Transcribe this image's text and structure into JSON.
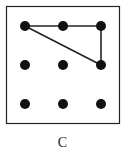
{
  "figure": {
    "label": "C",
    "box": {
      "x": 6,
      "y": 6,
      "w": 114,
      "h": 118,
      "stroke": "#222222"
    },
    "grid": {
      "cols_x": [
        25,
        63,
        101
      ],
      "rows_y": [
        26,
        65,
        104
      ],
      "dot_radius": 5,
      "dot_color": "#111111"
    },
    "lines": [
      {
        "from": [
          0,
          0
        ],
        "to": [
          1,
          0
        ]
      },
      {
        "from": [
          1,
          0
        ],
        "to": [
          2,
          0
        ]
      },
      {
        "from": [
          2,
          0
        ],
        "to": [
          2,
          1
        ]
      },
      {
        "from": [
          2,
          1
        ],
        "to": [
          0,
          0
        ]
      }
    ],
    "line_color": "#222222"
  }
}
